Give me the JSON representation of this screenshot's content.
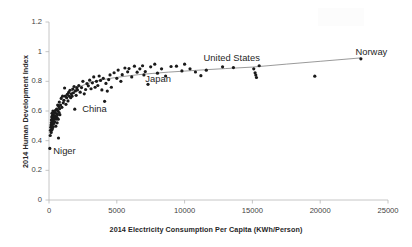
{
  "chart_data": {
    "type": "scatter",
    "title": "",
    "xlabel": "2014 Electricity Consumption Per Capita (KWh/Person)",
    "ylabel": "2014 Human Development Index",
    "xlim": [
      0,
      25000
    ],
    "ylim": [
      0,
      1.2
    ],
    "xticks": [
      0,
      5000,
      10000,
      15000,
      20000,
      25000
    ],
    "yticks": [
      0,
      0.2,
      0.4,
      0.6,
      0.8,
      1,
      1.2
    ],
    "xtick_labels": [
      "0",
      "5000",
      "10000",
      "15000",
      "20000",
      "25000"
    ],
    "ytick_labels": [
      "0",
      "0.2",
      "0.4",
      "0.6",
      "0.8",
      "1",
      "1.2"
    ],
    "grid": false,
    "legend": "none",
    "marker_color": "#1a1a1a",
    "marker_size": 1.6,
    "trendline": {
      "label": "logarithmic fit",
      "color": "#808080",
      "width": 0.8,
      "points": [
        [
          1700,
          0.738
        ],
        [
          2200,
          0.762
        ],
        [
          2800,
          0.784
        ],
        [
          3400,
          0.8
        ],
        [
          4000,
          0.812
        ],
        [
          4800,
          0.824
        ],
        [
          5600,
          0.834
        ],
        [
          6600,
          0.845
        ],
        [
          7600,
          0.853
        ],
        [
          8800,
          0.862
        ],
        [
          10000,
          0.869
        ],
        [
          11500,
          0.878
        ],
        [
          13000,
          0.886
        ],
        [
          15000,
          0.896
        ],
        [
          17500,
          0.916
        ],
        [
          20000,
          0.935
        ],
        [
          23000,
          0.958
        ]
      ]
    },
    "annotations": [
      {
        "text": "Niger",
        "x": 320,
        "y": 0.33,
        "anchor": "left"
      },
      {
        "text": "China",
        "x": 2450,
        "y": 0.615,
        "anchor": "left"
      },
      {
        "text": "Japan",
        "x": 7100,
        "y": 0.818,
        "anchor": "left"
      },
      {
        "text": "United States",
        "x": 11400,
        "y": 0.96,
        "anchor": "left"
      },
      {
        "text": "Norway",
        "x": 22600,
        "y": 0.998,
        "anchor": "left"
      }
    ],
    "points": [
      [
        60,
        0.348
      ],
      [
        90,
        0.435
      ],
      [
        110,
        0.47
      ],
      [
        130,
        0.49
      ],
      [
        150,
        0.505
      ],
      [
        160,
        0.455
      ],
      [
        170,
        0.52
      ],
      [
        180,
        0.54
      ],
      [
        190,
        0.47
      ],
      [
        200,
        0.56
      ],
      [
        210,
        0.5
      ],
      [
        220,
        0.585
      ],
      [
        230,
        0.53
      ],
      [
        240,
        0.545
      ],
      [
        250,
        0.48
      ],
      [
        260,
        0.57
      ],
      [
        270,
        0.51
      ],
      [
        280,
        0.555
      ],
      [
        290,
        0.6
      ],
      [
        300,
        0.492
      ],
      [
        320,
        0.535
      ],
      [
        330,
        0.575
      ],
      [
        340,
        0.515
      ],
      [
        360,
        0.56
      ],
      [
        380,
        0.545
      ],
      [
        400,
        0.59
      ],
      [
        420,
        0.525
      ],
      [
        440,
        0.565
      ],
      [
        460,
        0.555
      ],
      [
        480,
        0.604
      ],
      [
        500,
        0.498
      ],
      [
        520,
        0.545
      ],
      [
        540,
        0.583
      ],
      [
        560,
        0.612
      ],
      [
        580,
        0.558
      ],
      [
        600,
        0.52
      ],
      [
        620,
        0.575
      ],
      [
        640,
        0.64
      ],
      [
        660,
        0.6
      ],
      [
        680,
        0.545
      ],
      [
        700,
        0.418
      ],
      [
        720,
        0.63
      ],
      [
        740,
        0.59
      ],
      [
        760,
        0.66
      ],
      [
        780,
        0.615
      ],
      [
        800,
        0.575
      ],
      [
        850,
        0.64
      ],
      [
        900,
        0.685
      ],
      [
        950,
        0.625
      ],
      [
        1000,
        0.7
      ],
      [
        1050,
        0.655
      ],
      [
        1100,
        0.672
      ],
      [
        1150,
        0.755
      ],
      [
        1200,
        0.7
      ],
      [
        1250,
        0.645
      ],
      [
        1300,
        0.69
      ],
      [
        1350,
        0.712
      ],
      [
        1400,
        0.668
      ],
      [
        1450,
        0.725
      ],
      [
        1500,
        0.7
      ],
      [
        1550,
        0.74
      ],
      [
        1600,
        0.69
      ],
      [
        1650,
        0.716
      ],
      [
        1700,
        0.7
      ],
      [
        1750,
        0.748
      ],
      [
        1800,
        0.723
      ],
      [
        1850,
        0.765
      ],
      [
        1900,
        0.612
      ],
      [
        1950,
        0.735
      ],
      [
        2000,
        0.706
      ],
      [
        2050,
        0.758
      ],
      [
        2100,
        0.742
      ],
      [
        2200,
        0.772
      ],
      [
        2300,
        0.727
      ],
      [
        2400,
        0.758
      ],
      [
        2500,
        0.8
      ],
      [
        2600,
        0.716
      ],
      [
        2700,
        0.745
      ],
      [
        2800,
        0.785
      ],
      [
        2900,
        0.77
      ],
      [
        3000,
        0.808
      ],
      [
        3100,
        0.75
      ],
      [
        3200,
        0.79
      ],
      [
        3300,
        0.83
      ],
      [
        3400,
        0.76
      ],
      [
        3500,
        0.8
      ],
      [
        3600,
        0.772
      ],
      [
        3700,
        0.836
      ],
      [
        3800,
        0.806
      ],
      [
        3900,
        0.742
      ],
      [
        4000,
        0.82
      ],
      [
        4100,
        0.665
      ],
      [
        4200,
        0.786
      ],
      [
        4300,
        0.734
      ],
      [
        4400,
        0.812
      ],
      [
        4500,
        0.843
      ],
      [
        4600,
        0.76
      ],
      [
        4800,
        0.858
      ],
      [
        5000,
        0.82
      ],
      [
        5100,
        0.876
      ],
      [
        5300,
        0.8
      ],
      [
        5400,
        0.845
      ],
      [
        5600,
        0.89
      ],
      [
        5800,
        0.864
      ],
      [
        5900,
        0.886
      ],
      [
        6100,
        0.83
      ],
      [
        6300,
        0.902
      ],
      [
        6500,
        0.862
      ],
      [
        6700,
        0.884
      ],
      [
        6900,
        0.905
      ],
      [
        7000,
        0.843
      ],
      [
        7100,
        0.866
      ],
      [
        7300,
        0.78
      ],
      [
        7500,
        0.898
      ],
      [
        7800,
        0.916
      ],
      [
        8000,
        0.855
      ],
      [
        8300,
        0.884
      ],
      [
        8600,
        0.836
      ],
      [
        9000,
        0.9
      ],
      [
        9400,
        0.902
      ],
      [
        9800,
        0.87
      ],
      [
        10000,
        0.916
      ],
      [
        10400,
        0.884
      ],
      [
        10800,
        0.863
      ],
      [
        11200,
        0.838
      ],
      [
        11600,
        0.875
      ],
      [
        12800,
        0.898
      ],
      [
        13600,
        0.893
      ],
      [
        15100,
        0.884
      ],
      [
        15200,
        0.858
      ],
      [
        15250,
        0.842
      ],
      [
        15300,
        0.826
      ],
      [
        15500,
        0.905
      ],
      [
        19600,
        0.835
      ],
      [
        23000,
        0.952
      ]
    ]
  }
}
